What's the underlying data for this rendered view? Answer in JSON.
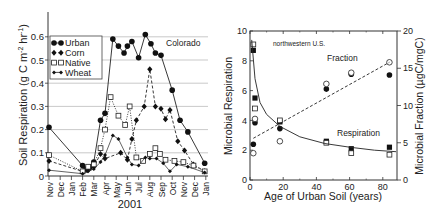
{
  "chart_data": [
    {
      "type": "line",
      "title": "",
      "annotation": "Colorado",
      "xlabel": "2001",
      "ylabel": "Soil Respiration (g C m-2 hr-1)",
      "ylim": [
        0,
        0.6
      ],
      "yticks": [
        "0",
        "0.1",
        "0.2",
        "0.3",
        "0.4",
        "0.5",
        "0.6"
      ],
      "grid": "horizontal",
      "legend_position": "upper-left",
      "categories": [
        "Nov",
        "Dec",
        "Jan",
        "Feb",
        "Mar",
        "Apr",
        "May",
        "Jun",
        "Jul",
        "Aug",
        "Sep",
        "Oct",
        "Nov",
        "Dec",
        "Jan"
      ],
      "series": [
        {
          "name": "Urban",
          "marker": "filled-circle",
          "line": "solid",
          "points": [
            [
              0,
              0.21
            ],
            [
              3.0,
              0.045
            ],
            [
              3.3,
              0.03
            ],
            [
              3.6,
              0.035
            ],
            [
              4.0,
              0.06
            ],
            [
              4.6,
              0.24
            ],
            [
              5.0,
              0.27
            ],
            [
              5.7,
              0.59
            ],
            [
              6.2,
              0.56
            ],
            [
              6.7,
              0.53
            ],
            [
              7.0,
              0.56
            ],
            [
              7.4,
              0.58
            ],
            [
              8.0,
              0.51
            ],
            [
              8.6,
              0.61
            ],
            [
              9.1,
              0.57
            ],
            [
              9.5,
              0.53
            ],
            [
              10.0,
              0.52
            ],
            [
              11.0,
              0.37
            ],
            [
              11.7,
              0.24
            ],
            [
              12.4,
              0.19
            ],
            [
              13.9,
              0.055
            ]
          ]
        },
        {
          "name": "Corn",
          "marker": "filled-diamond",
          "line": "dashed",
          "points": [
            [
              0,
              0.065
            ],
            [
              3.0,
              0.02
            ],
            [
              3.4,
              0.025
            ],
            [
              4.0,
              0.04
            ],
            [
              4.6,
              0.095
            ],
            [
              5.0,
              0.075
            ],
            [
              6.4,
              0.1
            ],
            [
              7.0,
              0.07
            ],
            [
              7.4,
              0.16
            ],
            [
              7.8,
              0.24
            ],
            [
              8.5,
              0.3
            ],
            [
              9.0,
              0.46
            ],
            [
              9.5,
              0.3
            ],
            [
              10.0,
              0.29
            ],
            [
              10.4,
              0.245
            ],
            [
              10.8,
              0.285
            ],
            [
              11.5,
              0.15
            ],
            [
              12.1,
              0.11
            ],
            [
              12.9,
              0.05
            ],
            [
              13.9,
              0.02
            ]
          ]
        },
        {
          "name": "Native",
          "marker": "open-square",
          "line": "dotted",
          "points": [
            [
              0,
              0.09
            ],
            [
              3.0,
              0.02
            ],
            [
              3.5,
              0.04
            ],
            [
              4.0,
              0.05
            ],
            [
              4.6,
              0.12
            ],
            [
              5.0,
              0.2
            ],
            [
              5.5,
              0.34
            ],
            [
              6.2,
              0.26
            ],
            [
              6.8,
              0.22
            ],
            [
              7.2,
              0.3
            ],
            [
              7.8,
              0.08
            ],
            [
              8.4,
              0.065
            ],
            [
              9.0,
              0.095
            ],
            [
              9.5,
              0.12
            ],
            [
              9.9,
              0.095
            ],
            [
              10.4,
              0.07
            ],
            [
              11.2,
              0.065
            ],
            [
              12.0,
              0.06
            ],
            [
              12.9,
              0.045
            ],
            [
              13.9,
              0.02
            ]
          ]
        },
        {
          "name": "Wheat",
          "marker": "small-diamond-cross",
          "line": "solid-thin",
          "points": [
            [
              0,
              0.025
            ],
            [
              3.0,
              0.01
            ],
            [
              3.5,
              0.02
            ],
            [
              4.0,
              0.03
            ],
            [
              4.6,
              0.06
            ],
            [
              5.0,
              0.09
            ],
            [
              5.7,
              0.175
            ],
            [
              6.2,
              0.16
            ],
            [
              7.0,
              0.08
            ],
            [
              7.4,
              0.05
            ],
            [
              8.0,
              0.045
            ],
            [
              8.6,
              0.08
            ],
            [
              9.0,
              0.075
            ],
            [
              9.6,
              0.075
            ],
            [
              10.2,
              0.055
            ],
            [
              10.8,
              0.02
            ],
            [
              11.4,
              0.05
            ],
            [
              12.4,
              0.04
            ],
            [
              13.9,
              0.015
            ]
          ]
        }
      ]
    },
    {
      "type": "scatter",
      "title": "",
      "annotation": "northwestern U.S.",
      "xlabel": "Age of Urban Soil (years)",
      "ylabel": "Microbial Respiration",
      "y2label": "Microbial Fraction (µgC/mgC)",
      "xlim": [
        0,
        90
      ],
      "ylim": [
        0,
        10
      ],
      "y2lim": [
        0,
        20
      ],
      "xticks": [
        "0",
        "20",
        "40",
        "60",
        "80"
      ],
      "yticks": [
        "0",
        "2",
        "4",
        "6",
        "8",
        "10"
      ],
      "y2ticks": [
        "0",
        "5",
        "10",
        "15",
        "20"
      ],
      "grid": "none",
      "series": [
        {
          "name": "Respiration (filled squares)",
          "axis": "left",
          "marker": "filled-square",
          "points": [
            [
              2,
              8.7
            ],
            [
              3,
              5.5
            ],
            [
              18,
              3.9
            ],
            [
              46,
              2.6
            ],
            [
              61,
              2.1
            ],
            [
              84,
              2.2
            ]
          ]
        },
        {
          "name": "Respiration (open squares)",
          "axis": "left",
          "marker": "open-square",
          "points": [
            [
              2,
              9.1
            ],
            [
              3,
              4.8
            ],
            [
              18,
              4.0
            ],
            [
              46,
              2.5
            ],
            [
              61,
              1.8
            ],
            [
              84,
              1.7
            ]
          ]
        },
        {
          "name": "Fraction (filled circles)",
          "axis": "right",
          "marker": "filled-circle",
          "points": [
            [
              2,
              4.8
            ],
            [
              3,
              7.7
            ],
            [
              18,
              6.9
            ],
            [
              46,
              12.2
            ],
            [
              61,
              14.2
            ],
            [
              84,
              14.1
            ]
          ]
        },
        {
          "name": "Fraction (open circles)",
          "axis": "right",
          "marker": "open-circle",
          "points": [
            [
              2,
              3.6
            ],
            [
              3,
              8.2
            ],
            [
              18,
              5.2
            ],
            [
              46,
              12.9
            ],
            [
              61,
              14.4
            ],
            [
              84,
              15.8
            ]
          ]
        },
        {
          "name": "Respiration fit",
          "axis": "left",
          "style": "solid-curve",
          "points": [
            [
              1,
              9.4
            ],
            [
              3,
              6.8
            ],
            [
              6,
              5.2
            ],
            [
              10,
              4.4
            ],
            [
              18,
              3.6
            ],
            [
              30,
              2.9
            ],
            [
              45,
              2.45
            ],
            [
              60,
              2.2
            ],
            [
              75,
              2.0
            ],
            [
              88,
              1.9
            ]
          ]
        },
        {
          "name": "Fraction fit",
          "axis": "right",
          "style": "dashed-line",
          "points": [
            [
              2,
              5.6
            ],
            [
              84,
              15.8
            ]
          ]
        }
      ],
      "labels": {
        "fraction": "Fraction",
        "respiration": "Respiration"
      }
    }
  ],
  "left_chart": {
    "ylabel_main": "Soil Respiration (g C m",
    "ylabel_sup1": "-2",
    "ylabel_mid": " hr",
    "ylabel_sup2": "-1",
    "ylabel_end": ")",
    "xlabel": "2001",
    "annotation": "Colorado",
    "legend": [
      "Urban",
      "Corn",
      "Native",
      "Wheat"
    ]
  },
  "right_chart": {
    "ylabel": "Microbial Respiration",
    "y2label": "Microbial Fraction (µgC/mgC)",
    "xlabel": "Age of Urban Soil (years)",
    "annotation": "northwestern U.S.",
    "label_fraction": "Fraction",
    "label_respiration": "Respiration"
  }
}
